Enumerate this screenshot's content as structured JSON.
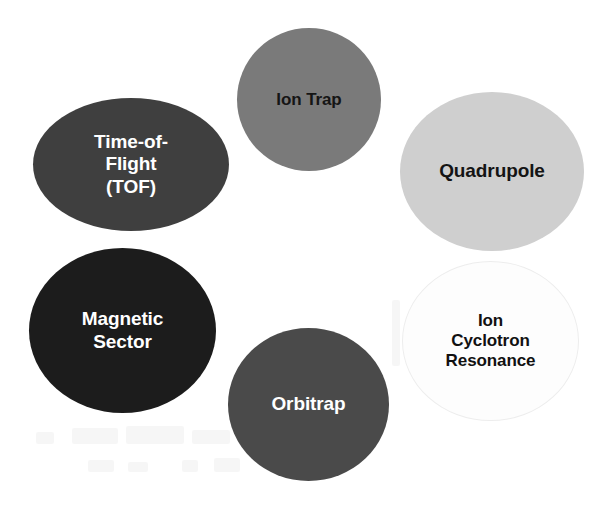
{
  "diagram": {
    "background_color": "#ffffff",
    "width": 612,
    "height": 507,
    "nodes": [
      {
        "id": "time-of-flight",
        "label": "Time-of-\nFlight\n(TOF)",
        "fill_color": "#3f3f3f",
        "text_color": "#ffffff",
        "shape": "ellipse"
      },
      {
        "id": "ion-trap",
        "label": "Ion Trap",
        "fill_color": "#7a7a7a",
        "text_color": "#151515",
        "shape": "ellipse"
      },
      {
        "id": "quadrupole",
        "label": "Quadrupole",
        "fill_color": "#cfcfcf",
        "text_color": "#141414",
        "shape": "ellipse"
      },
      {
        "id": "magnetic-sector",
        "label": "Magnetic\nSector",
        "fill_color": "#1c1c1c",
        "text_color": "#ffffff",
        "shape": "ellipse"
      },
      {
        "id": "orbitrap",
        "label": "Orbitrap",
        "fill_color": "#4a4a4a",
        "text_color": "#ffffff",
        "shape": "ellipse"
      },
      {
        "id": "ion-cyclotron-resonance",
        "label": "Ion\nCyclotron\nResonance",
        "fill_color": "#fdfdfd",
        "text_color": "#111111",
        "border_color": "#ededed",
        "shape": "ellipse"
      }
    ]
  }
}
